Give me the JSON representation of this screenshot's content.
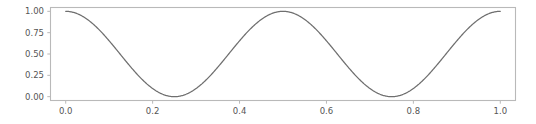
{
  "figure": {
    "background_color": "#ffffff",
    "width": 536,
    "height": 124
  },
  "chart_data": {
    "type": "line",
    "title": "",
    "subtitle": "",
    "xlabel": "",
    "ylabel": "",
    "xlim": [
      -0.035,
      1.035
    ],
    "ylim": [
      -0.045,
      1.045
    ],
    "grid": false,
    "legend": null,
    "legend_position": "none",
    "line_color": "#6f6f6f",
    "line_width": 1.25,
    "spine_color": "#b9b9b9",
    "tick_label_color": "#555555",
    "xticks": [
      0.0,
      0.2,
      0.4,
      0.6,
      0.8,
      1.0
    ],
    "xtick_labels": [
      "0.0",
      "0.2",
      "0.4",
      "0.6",
      "0.8",
      "1.0"
    ],
    "yticks": [
      0.0,
      0.25,
      0.5,
      0.75,
      1.0
    ],
    "ytick_labels": [
      "0.00",
      "0.25",
      "0.50",
      "0.75",
      "1.00"
    ],
    "series": [
      {
        "name": "cos^2(2*pi*x)",
        "x": [
          0.0,
          0.0125,
          0.025,
          0.0375,
          0.05,
          0.0625,
          0.075,
          0.0875,
          0.1,
          0.1125,
          0.125,
          0.1375,
          0.15,
          0.1625,
          0.175,
          0.1875,
          0.2,
          0.2125,
          0.225,
          0.2375,
          0.25,
          0.2625,
          0.275,
          0.2875,
          0.3,
          0.3125,
          0.325,
          0.3375,
          0.35,
          0.3625,
          0.375,
          0.3875,
          0.4,
          0.4125,
          0.425,
          0.4375,
          0.45,
          0.4625,
          0.475,
          0.4875,
          0.5,
          0.5125,
          0.525,
          0.5375,
          0.55,
          0.5625,
          0.575,
          0.5875,
          0.6,
          0.6125,
          0.625,
          0.6375,
          0.65,
          0.6625,
          0.675,
          0.6875,
          0.7,
          0.7125,
          0.725,
          0.7375,
          0.75,
          0.7625,
          0.775,
          0.7875,
          0.8,
          0.8125,
          0.825,
          0.8375,
          0.85,
          0.8625,
          0.875,
          0.8875,
          0.9,
          0.9125,
          0.925,
          0.9375,
          0.95,
          0.9625,
          0.975,
          0.9875,
          1.0
        ],
        "y": [
          1.0,
          0.9904,
          0.9619,
          0.9157,
          0.8536,
          0.7778,
          0.6913,
          0.5975,
          0.5,
          0.4025,
          0.3087,
          0.2222,
          0.1464,
          0.0843,
          0.0381,
          0.0096,
          0.0,
          0.0096,
          0.0381,
          0.0843,
          0.1464,
          0.2222,
          0.3087,
          0.4025,
          0.5,
          0.5975,
          0.6913,
          0.7778,
          0.8536,
          0.9157,
          0.9619,
          0.9904,
          1.0,
          0.9904,
          0.9619,
          0.9157,
          0.8536,
          0.7778,
          0.6913,
          0.5975,
          0.5,
          0.4025,
          0.3087,
          0.2222,
          0.1464,
          0.0843,
          0.0381,
          0.0096,
          0.0,
          0.0096,
          0.0381,
          0.0843,
          0.1464,
          0.2222,
          0.3087,
          0.4025,
          0.5,
          0.5975,
          0.6913,
          0.7778,
          0.8536,
          0.9157,
          0.9619,
          0.9904,
          1.0,
          0.9904,
          0.9619,
          0.9157,
          0.8536,
          0.7778,
          0.6913,
          0.5975,
          0.5,
          0.4025,
          0.3087,
          0.2222,
          0.1464,
          0.0843,
          0.0381,
          0.0096,
          1.0
        ]
      }
    ],
    "annotations": [],
    "peaks": [
      {
        "x": 0.0,
        "y": 1.0
      },
      {
        "x": 0.5,
        "y": 1.0
      },
      {
        "x": 1.0,
        "y": 1.0
      }
    ],
    "troughs": [
      {
        "x": 0.25,
        "y": 0.0
      },
      {
        "x": 0.75,
        "y": 0.0
      }
    ]
  }
}
